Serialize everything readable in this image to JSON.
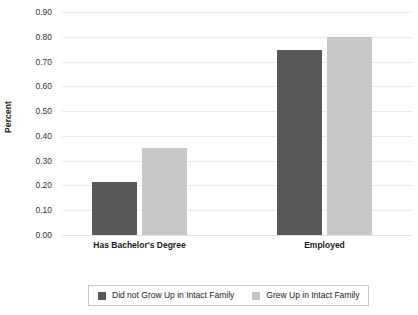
{
  "chart_data": {
    "type": "bar",
    "title": "",
    "xlabel": "",
    "ylabel": "Percent",
    "ylim": [
      0.0,
      0.9
    ],
    "ytick_step": 0.1,
    "grid": true,
    "legend_position": "bottom",
    "categories": [
      "Has Bachelor's Degree",
      "Employed"
    ],
    "ytick_labels": [
      "0.90",
      "0.80",
      "0.70",
      "0.60",
      "0.50",
      "0.40",
      "0.30",
      "0.20",
      "0.10",
      "0.00"
    ],
    "ytick_values": [
      0.9,
      0.8,
      0.7,
      0.6,
      0.5,
      0.4,
      0.3,
      0.2,
      0.1,
      0.0
    ],
    "series": [
      {
        "name": "Did not Grow Up in Intact Family",
        "color": "#58585a",
        "values": [
          0.215,
          0.745
        ]
      },
      {
        "name": "Grew Up in Intact Family",
        "color": "#c8c8c8",
        "values": [
          0.35,
          0.8
        ]
      }
    ]
  },
  "legend": {
    "items": [
      {
        "label": "Did not Grow Up in Intact Family",
        "color": "#58585a"
      },
      {
        "label": "Grew Up in Intact Family",
        "color": "#c8c8c8"
      }
    ]
  },
  "axis": {
    "y_title": "Percent"
  }
}
